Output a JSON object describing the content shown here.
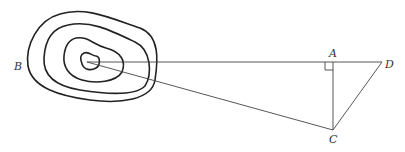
{
  "diagram": {
    "labels": {
      "A": "A",
      "B": "B",
      "C": "C",
      "D": "D"
    },
    "points": {
      "summit": [
        87,
        62
      ],
      "A": [
        333,
        62
      ],
      "C": [
        333,
        130
      ],
      "D": [
        382,
        62
      ]
    },
    "contours_count": 4,
    "right_angle_at": "A",
    "colors": {
      "line": "#222222",
      "background": "#ffffff"
    }
  }
}
